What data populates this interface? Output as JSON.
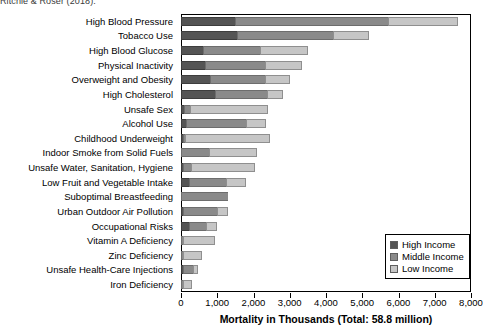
{
  "source_note": "Ritchie & Roser (2018).",
  "chart_data": {
    "type": "bar",
    "orientation": "horizontal",
    "stacked": true,
    "title": "",
    "xlabel": "Mortality in Thousands (Total: 58.8 million)",
    "ylabel": "",
    "xlim": [
      0,
      8000
    ],
    "xticks": [
      0,
      1000,
      2000,
      3000,
      4000,
      5000,
      6000,
      7000,
      8000
    ],
    "xtick_labels": [
      "0",
      "1,000",
      "2,000",
      "3,000",
      "4,000",
      "5,000",
      "6,000",
      "7,000",
      "8,000"
    ],
    "grid": false,
    "legend_position": "bottom-right",
    "categories": [
      "High Blood Pressure",
      "Tobacco Use",
      "High Blood Glucose",
      "Physical Inactivity",
      "Overweight and Obesity",
      "High Cholesterol",
      "Unsafe Sex",
      "Alcohol Use",
      "Childhood Underweight",
      "Indoor Smoke from Solid Fuels",
      "Unsafe Water, Sanitation, Hygiene",
      "Low Fruit and Vegetable Intake",
      "Suboptimal Breastfeeding",
      "Urban Outdoor Air Pollution",
      "Occupational Risks",
      "Vitamin A Deficiency",
      "Zinc Deficiency",
      "Unsafe Health-Care Injections",
      "Iron Deficiency"
    ],
    "series": [
      {
        "name": "High Income",
        "color": "#545454",
        "values": [
          1500,
          1550,
          600,
          660,
          800,
          940,
          70,
          150,
          10,
          0,
          10,
          230,
          0,
          60,
          210,
          0,
          0,
          10,
          0
        ]
      },
      {
        "name": "Middle Income",
        "color": "#8a8a8a",
        "values": [
          4200,
          2630,
          1580,
          1660,
          1520,
          1440,
          190,
          1640,
          10,
          770,
          230,
          1010,
          1300,
          940,
          490,
          10,
          10,
          280,
          30
        ]
      },
      {
        "name": "Low Income",
        "color": "#c6c6c6",
        "values": [
          1950,
          1010,
          1320,
          1030,
          690,
          440,
          2150,
          550,
          2340,
          1330,
          1750,
          550,
          0,
          290,
          280,
          880,
          530,
          140,
          250
        ]
      }
    ],
    "legend": [
      {
        "label": "High Income",
        "color": "#545454"
      },
      {
        "label": "Middle Income",
        "color": "#8a8a8a"
      },
      {
        "label": "Low Income",
        "color": "#c6c6c6"
      }
    ]
  }
}
